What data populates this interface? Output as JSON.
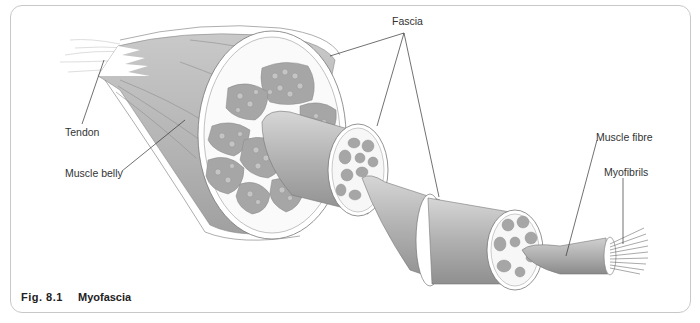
{
  "figure": {
    "caption_number": "Fig. 8.1",
    "caption_title": "Myofascia"
  },
  "labels": {
    "fascia": "Fascia",
    "tendon": "Tendon",
    "muscle_belly": "Muscle belly",
    "muscle_fibre": "Muscle fibre",
    "myofibrils": "Myofibrils"
  },
  "colors": {
    "tissue_dark": "#9a9a9a",
    "tissue_mid": "#b8b8b8",
    "tissue_light": "#d9d9d9",
    "fascicle_fill": "#a8a8a8",
    "sheath": "#f4f4f4",
    "leader_line": "#333333",
    "frame_border": "#c8c8c8"
  }
}
